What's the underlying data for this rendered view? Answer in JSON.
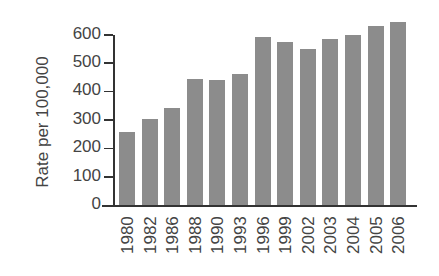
{
  "chart_data": {
    "type": "bar",
    "title": "",
    "xlabel": "",
    "ylabel": "Rate per 100,000",
    "ylim": [
      0,
      600
    ],
    "yticks": [
      0,
      100,
      200,
      300,
      400,
      500,
      600
    ],
    "grid": false,
    "legend": null,
    "categories": [
      "1980",
      "1982",
      "1986",
      "1988",
      "1990",
      "1993",
      "1996",
      "1999",
      "2002",
      "2003",
      "2004",
      "2005",
      "2006"
    ],
    "values": [
      257,
      303,
      341,
      444,
      441,
      460,
      590,
      573,
      548,
      583,
      600,
      631,
      644
    ],
    "bar_color": "#8c8c8c"
  }
}
